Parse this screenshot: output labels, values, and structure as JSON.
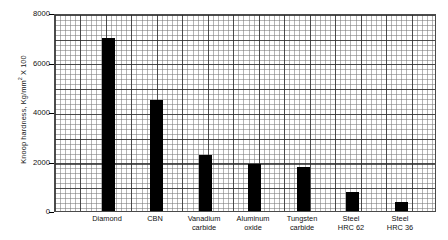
{
  "chart_data": {
    "type": "bar",
    "title": "",
    "xlabel": "",
    "ylabel": "Knoop hardness, Kg/mm² X 100",
    "ylabel_parts": {
      "pre": "Knoop hardness, Kg/mm",
      "sup": "2",
      "post": " X 100"
    },
    "categories": [
      "Diamond",
      "CBN",
      "Vanadium carbide",
      "Aluminum oxide",
      "Tungsten carbide",
      "Steel HRC 62",
      "Steel HRC 36"
    ],
    "category_lines": [
      [
        "Diamond",
        ""
      ],
      [
        "CBN",
        ""
      ],
      [
        "Vanadium",
        "carbide"
      ],
      [
        "Aluminum",
        "oxide"
      ],
      [
        "Tungsten",
        "carbide"
      ],
      [
        "Steel",
        "HRC 62"
      ],
      [
        "Steel",
        "HRC 36"
      ]
    ],
    "values": [
      7000,
      4500,
      2250,
      1900,
      1775,
      750,
      350
    ],
    "ylim": [
      0,
      8000
    ],
    "yticks": [
      0,
      2000,
      4000,
      6000,
      8000
    ],
    "ytick_labels": [
      "0",
      "2000",
      "4000",
      "6000",
      "8000"
    ],
    "grid": true,
    "grid_minor": true,
    "legend": false,
    "bar_color": "#000000",
    "plot_border_color": "#4a4a4a",
    "grid_major_color": "#282828",
    "grid_minor_color": "#787878"
  },
  "layout": {
    "plot_left_px": 54,
    "plot_top_px": 14,
    "plot_width_px": 382,
    "plot_height_px": 198,
    "bar_width_px": 13,
    "bar_centers_px": [
      53,
      101,
      150,
      199,
      248,
      297,
      346
    ]
  }
}
